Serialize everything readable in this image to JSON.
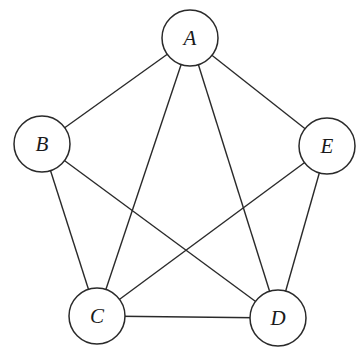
{
  "diagram": {
    "type": "undirected-graph",
    "colors": {
      "stroke": "#2a2a2a",
      "node_fill": "#ffffff",
      "label": "#1a1a1a",
      "background": "#ffffff"
    },
    "node_radius": 28,
    "nodes": [
      {
        "id": "A",
        "label": "A",
        "x": 190,
        "y": 38
      },
      {
        "id": "B",
        "label": "B",
        "x": 42,
        "y": 144
      },
      {
        "id": "E",
        "label": "E",
        "x": 327,
        "y": 146
      },
      {
        "id": "C",
        "label": "C",
        "x": 97,
        "y": 316
      },
      {
        "id": "D",
        "label": "D",
        "x": 278,
        "y": 318
      }
    ],
    "edges": [
      {
        "from": "A",
        "to": "B"
      },
      {
        "from": "A",
        "to": "E"
      },
      {
        "from": "A",
        "to": "C"
      },
      {
        "from": "A",
        "to": "D"
      },
      {
        "from": "B",
        "to": "C"
      },
      {
        "from": "B",
        "to": "D"
      },
      {
        "from": "E",
        "to": "C"
      },
      {
        "from": "E",
        "to": "D"
      },
      {
        "from": "C",
        "to": "D"
      }
    ]
  }
}
